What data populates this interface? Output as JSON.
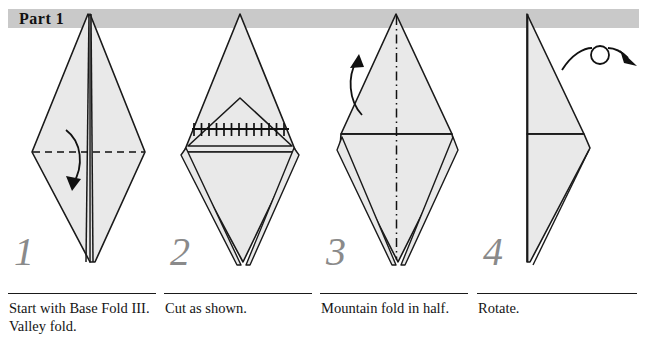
{
  "page": {
    "title": "Part 1",
    "background_color": "#ffffff",
    "banner_color": "#c9c9c9",
    "paper_fill_color": "#e9e9e9",
    "line_color": "#1a1a1a",
    "number_color": "#8a8a8a"
  },
  "steps": [
    {
      "number": "1",
      "caption": "Start with Base Fold III. Valley fold.",
      "fold_type": "valley",
      "fold_line": "horizontal-dashed",
      "arrow": "curved-down",
      "figure_name": "diamond-with-valley-fold"
    },
    {
      "number": "2",
      "caption": "Cut as shown.",
      "fold_type": "cut",
      "fold_line": "horizontal-cut-hatched",
      "arrow": "none",
      "figure_name": "diamond-with-folded-flap-and-cut-line"
    },
    {
      "number": "3",
      "caption": "Mountain fold in half.",
      "fold_type": "mountain",
      "fold_line": "vertical-dash-dot",
      "arrow": "curved-up-left",
      "figure_name": "diamond-with-mountain-fold"
    },
    {
      "number": "4",
      "caption": "Rotate.",
      "fold_type": "rotate",
      "fold_line": "none",
      "arrow": "rotate-loop",
      "figure_name": "side-profile-rotate"
    }
  ]
}
